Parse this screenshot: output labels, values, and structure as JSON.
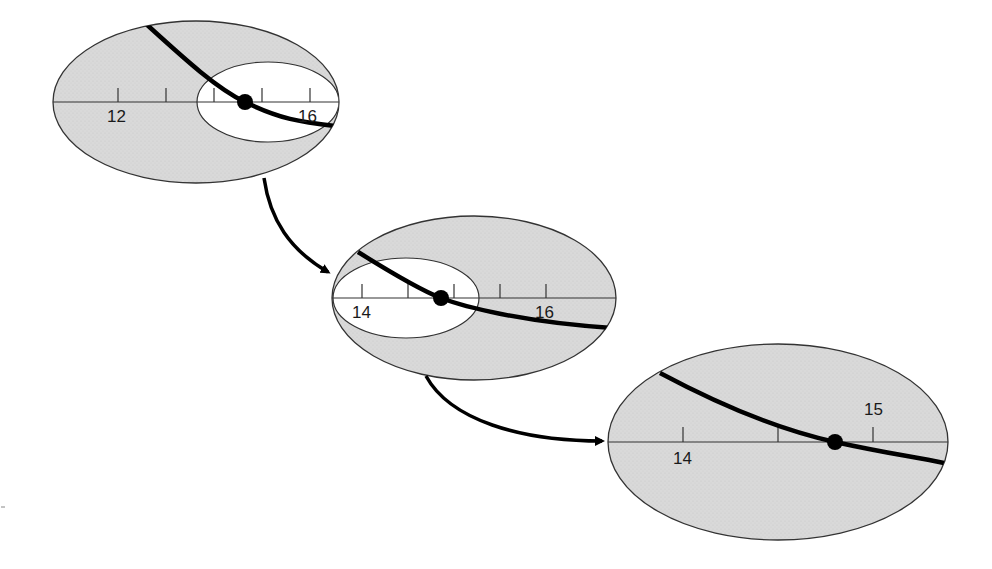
{
  "diagram": {
    "title": "",
    "colors": {
      "fill": "#d8d8d8",
      "inner": "#ffffff",
      "stroke": "#222222",
      "curve": "#000000"
    },
    "panels": [
      {
        "id": "zoom-level-1",
        "tick_labels": [
          "12",
          "16"
        ],
        "tick_count": 5,
        "has_inner_zoom_region": true
      },
      {
        "id": "zoom-level-2",
        "tick_labels": [
          "14",
          "16"
        ],
        "tick_count": 5,
        "has_inner_zoom_region": true
      },
      {
        "id": "zoom-level-3",
        "tick_labels": [
          "14",
          "15"
        ],
        "tick_count": 3,
        "has_inner_zoom_region": false
      }
    ],
    "arrows": [
      {
        "from": "zoom-level-1",
        "to": "zoom-level-2"
      },
      {
        "from": "zoom-level-2",
        "to": "zoom-level-3"
      }
    ]
  }
}
